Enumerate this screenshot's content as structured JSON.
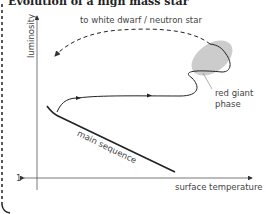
{
  "title": "Evolution of a high mass star",
  "axes": {
    "y_label": "luminosity",
    "x_label": "surface temperature",
    "origin_tick": "1"
  },
  "annotations": {
    "dashed_path": "to white dwarf / neutron star",
    "red_giant_line1": "red giant",
    "red_giant_line2": "phase",
    "main_sequence": "main sequence"
  },
  "colors": {
    "line": "#222222",
    "red_giant_region": "#cccccc",
    "axis": "#555555"
  }
}
